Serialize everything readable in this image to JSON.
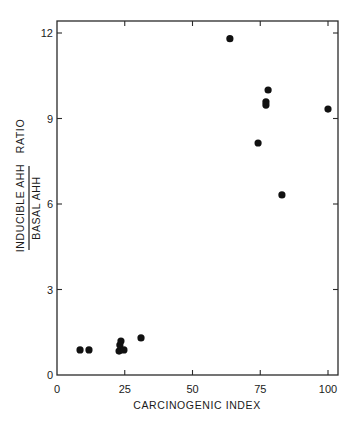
{
  "chart_data": {
    "type": "scatter",
    "title": "",
    "xlabel": "CARCINOGENIC INDEX",
    "ylabel": {
      "numerator": "INDUCIBLE AHH",
      "denominator": "BASAL AHH",
      "suffix": "RATIO"
    },
    "xlim": [
      0,
      100
    ],
    "ylim": [
      0,
      12
    ],
    "x_ticks": [
      0,
      25,
      50,
      75,
      100
    ],
    "x_tick_labels": [
      "0",
      "25",
      "50",
      "75",
      "100"
    ],
    "y_ticks": [
      0,
      3,
      6,
      9,
      12
    ],
    "y_tick_labels": [
      "0",
      "3",
      "6",
      "9",
      "12"
    ],
    "grid": false,
    "legend": null,
    "marker": "filled-circle",
    "marker_color": "#111111",
    "series": [
      {
        "name": "compounds",
        "points": [
          {
            "x": 8.5,
            "y": 0.88
          },
          {
            "x": 11.8,
            "y": 0.88
          },
          {
            "x": 22.9,
            "y": 0.84
          },
          {
            "x": 23.2,
            "y": 1.05
          },
          {
            "x": 23.6,
            "y": 1.19
          },
          {
            "x": 24.7,
            "y": 0.88
          },
          {
            "x": 31.0,
            "y": 1.3
          },
          {
            "x": 63.8,
            "y": 11.8
          },
          {
            "x": 74.2,
            "y": 8.14
          },
          {
            "x": 77.1,
            "y": 9.58
          },
          {
            "x": 77.1,
            "y": 9.47
          },
          {
            "x": 77.9,
            "y": 10.0
          },
          {
            "x": 83.0,
            "y": 6.32
          },
          {
            "x": 100.0,
            "y": 9.33
          }
        ]
      }
    ]
  }
}
